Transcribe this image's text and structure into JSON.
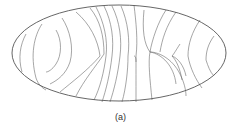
{
  "figure": {
    "caption": "(a)",
    "projection": "ellipse",
    "outline_color": "#555555",
    "line_color": "#666666"
  }
}
